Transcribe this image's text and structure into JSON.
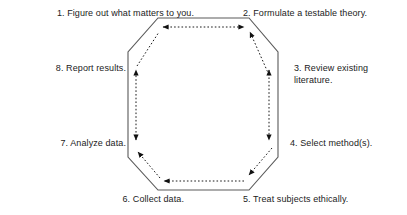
{
  "diagram": {
    "shape": "octagon",
    "outline_color": "#555555",
    "arrow_color": "#1a1a1a",
    "text_color": "#222222",
    "background_color": "#ffffff",
    "arrow_style": "dotted",
    "steps": [
      {
        "number": "1.",
        "text": "1. Figure out what matters to you.",
        "position": "top-left",
        "align": "right"
      },
      {
        "number": "2.",
        "text": "2. Formulate a testable theory.",
        "position": "top-right",
        "align": "left"
      },
      {
        "number": "3.",
        "text": "3. Review existing\nliterature.",
        "position": "right-upper",
        "align": "left"
      },
      {
        "number": "4.",
        "text": "4. Select method(s).",
        "position": "right-lower",
        "align": "left"
      },
      {
        "number": "5.",
        "text": "5. Treat subjects ethically.",
        "position": "bottom-right",
        "align": "left"
      },
      {
        "number": "6.",
        "text": "6. Collect data.",
        "position": "bottom-left",
        "align": "right"
      },
      {
        "number": "7.",
        "text": "7. Analyze data.",
        "position": "left-lower",
        "align": "right"
      },
      {
        "number": "8.",
        "text": "8. Report results.",
        "position": "left-upper",
        "align": "right"
      }
    ],
    "connectors": [
      {
        "name": "top-edge-arrow",
        "from": "1",
        "to": "2",
        "direction": "bidirectional",
        "style": "dotted"
      },
      {
        "name": "upper-right-diagonal-arrow",
        "from": "3",
        "to": "2",
        "direction": "up",
        "style": "dotted"
      },
      {
        "name": "right-edge-arrow",
        "from": "3",
        "to": "4",
        "direction": "bidirectional",
        "style": "dotted"
      },
      {
        "name": "lower-right-diagonal-arrow",
        "from": "4",
        "to": "5",
        "direction": "down-left",
        "style": "dotted"
      },
      {
        "name": "bottom-edge-arrow",
        "from": "5",
        "to": "6",
        "direction": "left",
        "style": "dotted"
      },
      {
        "name": "lower-left-diagonal-arrow",
        "from": "6",
        "to": "7",
        "direction": "up-left",
        "style": "dotted"
      },
      {
        "name": "left-edge-arrow",
        "from": "7",
        "to": "8",
        "direction": "bidirectional",
        "style": "dotted"
      },
      {
        "name": "upper-left-diagonal-arrow",
        "from": "8",
        "to": "1",
        "direction": "up-right",
        "style": "dotted"
      }
    ]
  }
}
